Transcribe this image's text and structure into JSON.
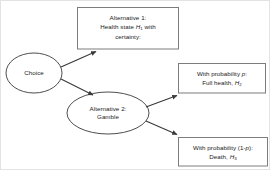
{
  "diagram": {
    "type": "decision-tree",
    "colors": {
      "background": "#ffffff",
      "stroke": "#3a3a3a",
      "box_stroke": "#808080",
      "text": "#1a1a1a",
      "page_border": "#e3e3e3"
    },
    "nodes": [
      {
        "id": "choice",
        "shape": "ellipse",
        "lines": [
          "Choice"
        ]
      },
      {
        "id": "alternative-2",
        "shape": "ellipse",
        "lines": [
          "Alternative 2:",
          "Gamble"
        ]
      },
      {
        "id": "alternative-1",
        "shape": "rect",
        "lines": [
          "Alternative 1:",
          "Health state H1 with",
          "certainty:"
        ],
        "line1": "Alternative 1:",
        "line2_pre": "Health state ",
        "line2_var": "H",
        "line2_sub": "1",
        "line2_post": " with",
        "line3": "certainty:"
      },
      {
        "id": "outcome-full-health",
        "shape": "rect",
        "line1_pre": "With probability ",
        "line1_var": "p",
        "line1_post": ":",
        "line2_pre": "Full health, ",
        "line2_var": "H",
        "line2_sub": "2"
      },
      {
        "id": "outcome-death",
        "shape": "rect",
        "line1_pre": "With probability (1-",
        "line1_var": "p",
        "line1_post": "):",
        "line2_pre": "Death, ",
        "line2_var": "H",
        "line2_sub": "3"
      }
    ],
    "edges": [
      {
        "id": "choice-to-alt1",
        "from": "choice",
        "to": "alternative-1"
      },
      {
        "id": "choice-to-alt2",
        "from": "choice",
        "to": "alternative-2"
      },
      {
        "id": "alt2-to-full-health",
        "from": "alternative-2",
        "to": "outcome-full-health"
      },
      {
        "id": "alt2-to-death",
        "from": "alternative-2",
        "to": "outcome-death"
      }
    ]
  }
}
